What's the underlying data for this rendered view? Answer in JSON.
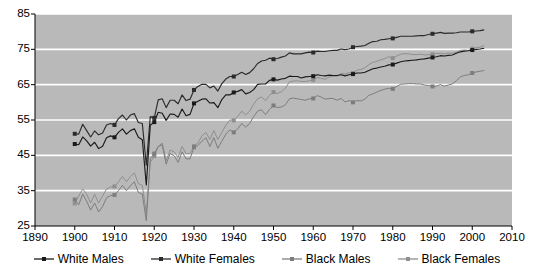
{
  "chart_data": {
    "type": "line",
    "title": "",
    "xlabel": "",
    "ylabel": "",
    "xlim": [
      1890,
      2010
    ],
    "ylim": [
      25,
      85
    ],
    "xticks": [
      1890,
      1900,
      1910,
      1920,
      1930,
      1940,
      1950,
      1960,
      1970,
      1980,
      1990,
      2000,
      2010
    ],
    "yticks": [
      25,
      35,
      45,
      55,
      65,
      75,
      85
    ],
    "grid": "horizontal",
    "legend_position": "bottom",
    "plot_background": "#b9b9b9",
    "gridline_color": "#ffffff",
    "series": [
      {
        "name": "White Males",
        "color": "#1a1a1a",
        "marker": "square",
        "marker_years": [
          1900,
          1910,
          1920,
          1930,
          1940,
          1950,
          1960,
          1970,
          1980,
          1990,
          2000
        ],
        "marker_values": [
          48.2,
          50.1,
          54.4,
          59.7,
          62.8,
          66.5,
          67.4,
          68.0,
          70.7,
          72.7,
          74.8
        ],
        "x": [
          1900,
          1901,
          1902,
          1903,
          1904,
          1905,
          1906,
          1907,
          1908,
          1909,
          1910,
          1911,
          1912,
          1913,
          1914,
          1915,
          1916,
          1917,
          1918,
          1919,
          1920,
          1921,
          1922,
          1923,
          1924,
          1925,
          1926,
          1927,
          1928,
          1929,
          1930,
          1931,
          1932,
          1933,
          1934,
          1935,
          1936,
          1937,
          1938,
          1939,
          1940,
          1941,
          1942,
          1943,
          1944,
          1945,
          1946,
          1947,
          1948,
          1949,
          1950,
          1951,
          1952,
          1953,
          1954,
          1955,
          1956,
          1957,
          1958,
          1959,
          1960,
          1961,
          1962,
          1963,
          1964,
          1965,
          1966,
          1967,
          1968,
          1969,
          1970,
          1971,
          1972,
          1973,
          1974,
          1975,
          1976,
          1977,
          1978,
          1979,
          1980,
          1981,
          1982,
          1983,
          1984,
          1985,
          1986,
          1987,
          1988,
          1989,
          1990,
          1991,
          1992,
          1993,
          1994,
          1995,
          1996,
          1997,
          1998,
          1999,
          2000,
          2001,
          2002,
          2003
        ],
        "y": [
          48.2,
          48.0,
          50.2,
          49.1,
          47.6,
          48.7,
          46.9,
          47.6,
          50.0,
          50.5,
          50.1,
          51.5,
          52.5,
          51.0,
          52.0,
          52.5,
          50.1,
          49.4,
          36.6,
          53.5,
          54.4,
          57.2,
          56.9,
          54.9,
          56.7,
          56.6,
          55.8,
          58.1,
          56.2,
          56.6,
          59.7,
          60.3,
          60.9,
          61.0,
          59.8,
          59.9,
          58.5,
          60.8,
          62.1,
          62.1,
          62.8,
          63.1,
          63.6,
          62.4,
          62.8,
          63.6,
          65.1,
          65.2,
          65.2,
          66.2,
          66.5,
          66.3,
          66.6,
          66.8,
          67.4,
          67.3,
          67.3,
          66.9,
          67.2,
          67.3,
          67.4,
          67.8,
          67.6,
          67.5,
          67.7,
          67.6,
          67.6,
          67.8,
          67.5,
          67.8,
          68.0,
          68.3,
          68.3,
          68.5,
          69.0,
          69.5,
          69.7,
          70.0,
          70.2,
          70.6,
          70.7,
          71.1,
          71.5,
          71.7,
          71.8,
          71.9,
          72.0,
          72.2,
          72.3,
          72.5,
          72.7,
          72.9,
          73.2,
          73.1,
          73.3,
          73.4,
          73.9,
          74.3,
          74.5,
          74.6,
          74.8,
          75.0,
          75.1,
          75.3
        ]
      },
      {
        "name": "White Females",
        "color": "#2b2b2b",
        "marker": "square",
        "marker_years": [
          1900,
          1910,
          1920,
          1930,
          1940,
          1950,
          1960,
          1970,
          1980,
          1990,
          2000
        ],
        "marker_values": [
          51.1,
          53.6,
          55.6,
          63.5,
          67.3,
          72.2,
          74.1,
          75.6,
          78.1,
          79.4,
          80.1
        ],
        "x": [
          1900,
          1901,
          1902,
          1903,
          1904,
          1905,
          1906,
          1907,
          1908,
          1909,
          1910,
          1911,
          1912,
          1913,
          1914,
          1915,
          1916,
          1917,
          1918,
          1919,
          1920,
          1921,
          1922,
          1923,
          1924,
          1925,
          1926,
          1927,
          1928,
          1929,
          1930,
          1931,
          1932,
          1933,
          1934,
          1935,
          1936,
          1937,
          1938,
          1939,
          1940,
          1941,
          1942,
          1943,
          1944,
          1945,
          1946,
          1947,
          1948,
          1949,
          1950,
          1951,
          1952,
          1953,
          1954,
          1955,
          1956,
          1957,
          1958,
          1959,
          1960,
          1961,
          1962,
          1963,
          1964,
          1965,
          1966,
          1967,
          1968,
          1969,
          1970,
          1971,
          1972,
          1973,
          1974,
          1975,
          1976,
          1977,
          1978,
          1979,
          1980,
          1981,
          1982,
          1983,
          1984,
          1985,
          1986,
          1987,
          1988,
          1989,
          1990,
          1991,
          1992,
          1993,
          1994,
          1995,
          1996,
          1997,
          1998,
          1999,
          2000,
          2001,
          2002,
          2003
        ],
        "y": [
          51.1,
          51.0,
          53.8,
          52.0,
          50.2,
          51.9,
          50.8,
          51.3,
          53.6,
          54.0,
          53.6,
          55.4,
          56.4,
          55.0,
          56.4,
          56.8,
          54.3,
          54.0,
          42.2,
          56.0,
          55.6,
          60.7,
          61.0,
          58.5,
          60.6,
          60.6,
          59.6,
          62.1,
          60.5,
          60.9,
          63.5,
          64.5,
          65.1,
          65.1,
          64.1,
          64.6,
          63.2,
          65.3,
          66.6,
          67.3,
          67.3,
          67.9,
          68.5,
          67.9,
          68.4,
          69.5,
          71.0,
          71.7,
          71.9,
          72.5,
          72.2,
          72.4,
          72.8,
          73.1,
          74.0,
          73.7,
          73.7,
          73.7,
          74.0,
          74.2,
          74.1,
          74.5,
          74.4,
          74.4,
          74.6,
          74.7,
          74.7,
          75.1,
          74.9,
          75.1,
          75.6,
          75.8,
          75.9,
          76.1,
          76.7,
          77.2,
          77.3,
          77.7,
          77.8,
          78.0,
          78.1,
          78.4,
          78.7,
          78.7,
          78.7,
          78.7,
          78.8,
          78.9,
          78.9,
          79.2,
          79.4,
          79.6,
          79.8,
          79.5,
          79.6,
          79.6,
          79.7,
          79.9,
          79.9,
          79.9,
          80.1,
          80.2,
          80.3,
          80.5
        ]
      },
      {
        "name": "Black Males",
        "color": "#7d7d7d",
        "marker": "square",
        "marker_years": [
          1900,
          1910,
          1920,
          1930,
          1940,
          1950,
          1960,
          1970,
          1980,
          1990,
          2000
        ],
        "marker_values": [
          32.5,
          33.8,
          45.5,
          47.3,
          51.5,
          59.1,
          61.1,
          60.0,
          63.8,
          64.5,
          68.3
        ],
        "x": [
          1900,
          1901,
          1902,
          1903,
          1904,
          1905,
          1906,
          1907,
          1908,
          1909,
          1910,
          1911,
          1912,
          1913,
          1914,
          1915,
          1916,
          1917,
          1918,
          1919,
          1920,
          1921,
          1922,
          1923,
          1924,
          1925,
          1926,
          1927,
          1928,
          1929,
          1930,
          1931,
          1932,
          1933,
          1934,
          1935,
          1936,
          1937,
          1938,
          1939,
          1940,
          1941,
          1942,
          1943,
          1944,
          1945,
          1946,
          1947,
          1948,
          1949,
          1950,
          1951,
          1952,
          1953,
          1954,
          1955,
          1956,
          1957,
          1958,
          1959,
          1960,
          1961,
          1962,
          1963,
          1964,
          1965,
          1966,
          1967,
          1968,
          1969,
          1970,
          1971,
          1972,
          1973,
          1974,
          1975,
          1976,
          1977,
          1978,
          1979,
          1980,
          1981,
          1982,
          1983,
          1984,
          1985,
          1986,
          1987,
          1988,
          1989,
          1990,
          1991,
          1992,
          1993,
          1994,
          1995,
          1996,
          1997,
          1998,
          1999,
          2000,
          2001,
          2002,
          2003
        ],
        "y": [
          32.5,
          31.0,
          34.0,
          32.0,
          29.5,
          31.5,
          29.0,
          30.5,
          33.0,
          33.6,
          33.8,
          35.0,
          36.5,
          35.0,
          36.4,
          37.5,
          34.5,
          34.0,
          26.5,
          44.0,
          45.5,
          47.5,
          48.0,
          42.5,
          45.5,
          44.9,
          43.0,
          46.0,
          44.0,
          44.0,
          47.3,
          47.8,
          49.0,
          50.0,
          47.5,
          50.0,
          47.0,
          49.0,
          51.0,
          52.2,
          51.5,
          52.5,
          54.0,
          53.0,
          54.0,
          56.0,
          57.5,
          57.9,
          56.5,
          58.0,
          59.1,
          58.5,
          58.7,
          59.3,
          61.0,
          61.2,
          61.0,
          60.8,
          60.6,
          61.0,
          61.1,
          61.9,
          61.5,
          60.9,
          61.1,
          61.1,
          60.6,
          61.1,
          60.1,
          60.5,
          60.0,
          60.5,
          60.4,
          60.9,
          62.0,
          62.4,
          62.9,
          63.4,
          63.7,
          64.0,
          63.8,
          64.5,
          65.1,
          65.2,
          65.3,
          65.3,
          65.2,
          65.2,
          64.9,
          64.8,
          64.5,
          64.6,
          65.0,
          64.6,
          64.9,
          65.2,
          66.1,
          67.2,
          67.6,
          67.8,
          68.3,
          68.6,
          68.8,
          69.0
        ]
      },
      {
        "name": "Black Females",
        "color": "#8f8f8f",
        "marker": "square",
        "marker_years": [
          1900,
          1910,
          1920,
          1930,
          1940,
          1950,
          1960,
          1970,
          1980,
          1990,
          2000
        ],
        "marker_values": [
          31.4,
          36.2,
          44.8,
          47.6,
          54.9,
          62.9,
          66.3,
          68.3,
          72.5,
          73.6,
          75.2
        ],
        "x": [
          1900,
          1901,
          1902,
          1903,
          1904,
          1905,
          1906,
          1907,
          1908,
          1909,
          1910,
          1911,
          1912,
          1913,
          1914,
          1915,
          1916,
          1917,
          1918,
          1919,
          1920,
          1921,
          1922,
          1923,
          1924,
          1925,
          1926,
          1927,
          1928,
          1929,
          1930,
          1931,
          1932,
          1933,
          1934,
          1935,
          1936,
          1937,
          1938,
          1939,
          1940,
          1941,
          1942,
          1943,
          1944,
          1945,
          1946,
          1947,
          1948,
          1949,
          1950,
          1951,
          1952,
          1953,
          1954,
          1955,
          1956,
          1957,
          1958,
          1959,
          1960,
          1961,
          1962,
          1963,
          1964,
          1965,
          1966,
          1967,
          1968,
          1969,
          1970,
          1971,
          1972,
          1973,
          1974,
          1975,
          1976,
          1977,
          1978,
          1979,
          1980,
          1981,
          1982,
          1983,
          1984,
          1985,
          1986,
          1987,
          1988,
          1989,
          1990,
          1991,
          1992,
          1993,
          1994,
          1995,
          1996,
          1997,
          1998,
          1999,
          2000,
          2001,
          2002,
          2003
        ],
        "y": [
          31.4,
          33.5,
          35.5,
          34.0,
          31.5,
          34.0,
          31.5,
          33.5,
          35.5,
          36.0,
          36.2,
          37.5,
          39.0,
          37.5,
          39.0,
          40.0,
          37.0,
          36.5,
          28.5,
          43.0,
          44.8,
          47.5,
          48.5,
          43.5,
          46.5,
          46.0,
          44.5,
          47.5,
          45.5,
          45.5,
          47.6,
          48.5,
          50.5,
          51.5,
          49.5,
          52.0,
          49.5,
          51.5,
          53.5,
          55.0,
          54.9,
          56.0,
          57.5,
          56.5,
          57.5,
          59.5,
          61.0,
          61.5,
          60.5,
          62.0,
          62.9,
          62.5,
          63.0,
          64.0,
          65.8,
          66.0,
          66.1,
          65.9,
          65.9,
          66.1,
          66.3,
          67.0,
          66.8,
          66.5,
          67.2,
          67.4,
          67.4,
          68.2,
          68.0,
          68.4,
          68.3,
          69.1,
          69.3,
          69.8,
          70.7,
          71.3,
          71.6,
          72.0,
          72.4,
          72.9,
          72.5,
          73.1,
          73.6,
          73.8,
          73.7,
          73.5,
          73.5,
          73.6,
          73.4,
          73.5,
          73.6,
          73.8,
          73.9,
          73.7,
          73.9,
          73.9,
          74.2,
          74.7,
          74.8,
          74.7,
          75.2,
          75.5,
          75.6,
          76.1
        ]
      }
    ]
  },
  "axes": {
    "y_labels": [
      "85",
      "75",
      "65",
      "55",
      "45",
      "35",
      "25"
    ],
    "x_labels": [
      "1890",
      "1900",
      "1910",
      "1920",
      "1930",
      "1940",
      "1950",
      "1960",
      "1970",
      "1980",
      "1990",
      "2000",
      "2010"
    ]
  },
  "legend": {
    "items": [
      {
        "label": "White Males",
        "color": "#1a1a1a"
      },
      {
        "label": "White Females",
        "color": "#2b2b2b"
      },
      {
        "label": "Black Males",
        "color": "#7d7d7d"
      },
      {
        "label": "Black Females",
        "color": "#8f8f8f"
      }
    ]
  }
}
